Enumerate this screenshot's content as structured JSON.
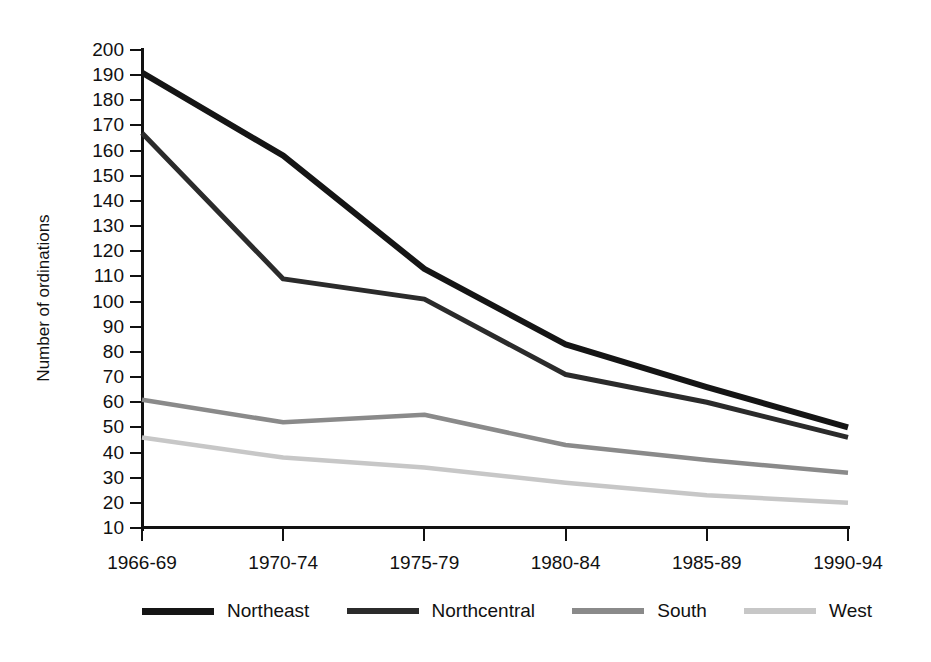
{
  "chart_data": {
    "type": "line",
    "title": "",
    "xlabel": "",
    "ylabel": "Number of ordinations",
    "categories": [
      "1966-69",
      "1970-74",
      "1975-79",
      "1980-84",
      "1985-89",
      "1990-94"
    ],
    "ylim": [
      10,
      200
    ],
    "ytick_step": 10,
    "yticks": [
      200,
      190,
      180,
      170,
      160,
      150,
      140,
      130,
      120,
      110,
      100,
      90,
      80,
      70,
      60,
      50,
      40,
      30,
      20,
      10
    ],
    "grid": false,
    "legend_position": "bottom",
    "series": [
      {
        "name": "Northeast",
        "values": [
          191,
          158,
          113,
          83,
          66,
          50
        ],
        "color": "#151515",
        "width": 6.0
      },
      {
        "name": "Northcentral",
        "values": [
          167,
          109,
          101,
          71,
          60,
          46
        ],
        "color": "#2b2b2b",
        "width": 5.0
      },
      {
        "name": "South",
        "values": [
          61,
          52,
          55,
          43,
          37,
          32
        ],
        "color": "#8a8a8a",
        "width": 4.5
      },
      {
        "name": "West",
        "values": [
          46,
          38,
          34,
          28,
          23,
          20
        ],
        "color": "#c7c7c7",
        "width": 4.5
      }
    ]
  },
  "axes": {
    "y_title": "Number of ordinations"
  },
  "legend": {
    "items": [
      {
        "label": "Northeast"
      },
      {
        "label": "Northcentral"
      },
      {
        "label": "South"
      },
      {
        "label": "West"
      }
    ]
  }
}
